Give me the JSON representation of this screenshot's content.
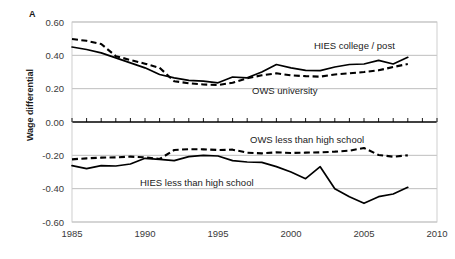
{
  "panel": {
    "letter": "A"
  },
  "axes": {
    "ylabel": "Wage differential",
    "yticks": [
      "0.60",
      "0.40",
      "0.20",
      "0.00",
      "-0.20",
      "-0.40",
      "-0.60"
    ],
    "xticks": [
      "1985",
      "1990",
      "1995",
      "2000",
      "2005",
      "2010"
    ]
  },
  "annotations": {
    "hies_college": "HIES college / post",
    "ows_university": "OWS university",
    "ows_lths": "OWS less than high school",
    "hies_lths": "HIES less than high school"
  },
  "chart_data": {
    "type": "line",
    "title": "",
    "xlabel": "",
    "ylabel": "Wage differential",
    "xlim": [
      1985,
      2010
    ],
    "ylim": [
      -0.6,
      0.6
    ],
    "ytick_values": [
      0.6,
      0.4,
      0.2,
      0.0,
      -0.2,
      -0.4,
      -0.6
    ],
    "xtick_values": [
      1985,
      1990,
      1995,
      2000,
      2005,
      2010
    ],
    "grid": "horizontal",
    "legend": "inline-annotations",
    "x": [
      1985,
      1986,
      1987,
      1988,
      1989,
      1990,
      1991,
      1992,
      1993,
      1994,
      1995,
      1996,
      1997,
      1998,
      1999,
      2000,
      2001,
      2002,
      2003,
      2004,
      2005,
      2006,
      2007,
      2008
    ],
    "series": [
      {
        "name": "HIES college / post",
        "style": "solid",
        "color": "#000000",
        "values": [
          0.45,
          0.435,
          0.415,
          0.385,
          0.355,
          0.325,
          0.285,
          0.265,
          0.25,
          0.245,
          0.235,
          0.27,
          0.265,
          0.3,
          0.345,
          0.325,
          0.31,
          0.308,
          0.33,
          0.345,
          0.348,
          0.37,
          0.348,
          0.388
        ]
      },
      {
        "name": "OWS university",
        "style": "dashed",
        "color": "#000000",
        "values": [
          0.498,
          0.487,
          0.468,
          0.395,
          0.372,
          0.35,
          0.325,
          0.245,
          0.232,
          0.225,
          0.222,
          0.235,
          0.262,
          0.28,
          0.292,
          0.28,
          0.275,
          0.272,
          0.285,
          0.292,
          0.3,
          0.31,
          0.33,
          0.348
        ]
      },
      {
        "name": "OWS less than high school",
        "style": "dashed",
        "color": "#000000",
        "values": [
          -0.224,
          -0.218,
          -0.214,
          -0.212,
          -0.208,
          -0.212,
          -0.222,
          -0.168,
          -0.163,
          -0.164,
          -0.168,
          -0.166,
          -0.184,
          -0.188,
          -0.182,
          -0.186,
          -0.184,
          -0.182,
          -0.178,
          -0.172,
          -0.156,
          -0.198,
          -0.208,
          -0.2
        ]
      },
      {
        "name": "HIES less than high school",
        "style": "solid",
        "color": "#000000",
        "values": [
          -0.262,
          -0.28,
          -0.262,
          -0.264,
          -0.252,
          -0.218,
          -0.224,
          -0.232,
          -0.208,
          -0.2,
          -0.204,
          -0.232,
          -0.24,
          -0.242,
          -0.268,
          -0.3,
          -0.34,
          -0.268,
          -0.4,
          -0.448,
          -0.488,
          -0.448,
          -0.432,
          -0.392
        ]
      }
    ]
  }
}
